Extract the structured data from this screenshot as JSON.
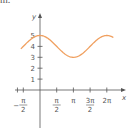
{
  "top_fragment": "m.",
  "chart_data": {
    "type": "line",
    "title": "",
    "function": "y = 4 + cos(x)",
    "xlabel": "x",
    "ylabel": "y",
    "x_ticks": [
      "-π/2",
      "π/2",
      "π",
      "3π/2",
      "2π"
    ],
    "y_ticks": [
      "1",
      "2",
      "3",
      "4",
      "5"
    ],
    "xlim": [
      -1.85,
      7.0
    ],
    "ylim": [
      -2.9,
      6.5
    ],
    "grid": false,
    "legend": null,
    "series": [
      {
        "name": "curve",
        "color": "#f0a060",
        "x": [
          -1.8,
          -1.5708,
          -0.7854,
          0,
          0.7854,
          1.5708,
          2.3562,
          3.1416,
          3.927,
          4.7124,
          5.4978,
          6.2832,
          6.9
        ],
        "y": [
          3.77,
          4.0,
          4.71,
          5.0,
          4.71,
          4.0,
          3.29,
          3.0,
          3.29,
          4.0,
          4.71,
          5.0,
          4.81
        ]
      }
    ]
  },
  "colors": {
    "axis": "#555555",
    "curve": "#f0a060"
  }
}
